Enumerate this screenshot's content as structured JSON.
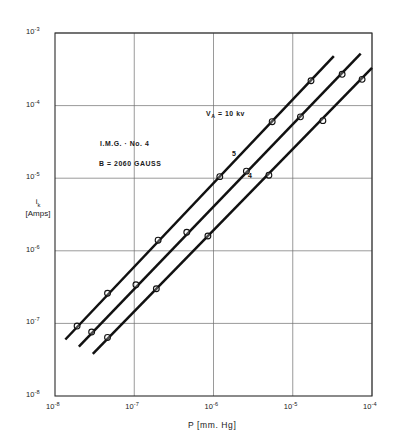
{
  "figure": {
    "title": "",
    "background": "#ffffff",
    "line_color": "#111111",
    "grid_color": "#6f6f6f",
    "frame_color": "#2b2b2b"
  },
  "axes": {
    "x": {
      "label": "P [mm. Hg]",
      "label_text": "P",
      "label_unit": "[mm. Hg]",
      "ticks": [
        "10",
        "10",
        "10",
        "10",
        "10"
      ],
      "exponents": [
        "-8",
        "-7",
        "-6",
        "-5",
        "-4"
      ],
      "min_exp": -8,
      "max_exp": -4
    },
    "y": {
      "label_symbol": "i",
      "label_sub": "k",
      "label_unit": "[Amps]",
      "ticks": [
        "10",
        "10",
        "10",
        "10",
        "10",
        "10"
      ],
      "exponents": [
        "-3",
        "-4",
        "-5",
        "-6",
        "-7",
        "-8"
      ],
      "min_exp": -8,
      "max_exp": -3
    }
  },
  "annotations": {
    "device": "I.M.G. · No. 4",
    "field": "B = 2060  GAUSS",
    "voltage_symbol": "V",
    "voltage_sub": "A",
    "voltage_value": "= 10 kv",
    "voltage_full": "V_A = 10 kv"
  },
  "curve_labels": [
    {
      "text": "5",
      "x": 232,
      "y": 150
    },
    {
      "text": "4",
      "x": 248,
      "y": 172
    }
  ],
  "chart_data": {
    "type": "line",
    "title": "",
    "subtitle": "I.M.G. · No. 4 ; B = 2060 GAUSS ; V_A = 10 kv",
    "xlabel": "P [mm. Hg]",
    "ylabel": "i_k [Amps]",
    "xscale": "log",
    "yscale": "log",
    "xlim": [
      1e-08,
      0.0001
    ],
    "ylim": [
      1e-08,
      0.001
    ],
    "xticks": [
      1e-08,
      1e-07,
      1e-06,
      1e-05,
      0.0001
    ],
    "yticks": [
      1e-08,
      1e-07,
      1e-06,
      1e-05,
      0.0001,
      0.001
    ],
    "xticklabels": [
      "10^-8",
      "10^-7",
      "10^-6",
      "10^-5",
      "10^-4"
    ],
    "yticklabels": [
      "10^-8",
      "10^-7",
      "10^-6",
      "10^-5",
      "10^-4",
      "10^-3"
    ],
    "grid": true,
    "legend": "inline-curve-labels",
    "legend_position": "inside-plot",
    "series": [
      {
        "name": "6",
        "label_shown": false,
        "marker": "open-circle",
        "x": [
          1.9e-08,
          4.6e-08,
          2e-07,
          1.2e-06,
          5.5e-06,
          1.7e-05
        ],
        "y": [
          9.2e-08,
          2.6e-07,
          1.4e-06,
          1.05e-05,
          6e-05,
          0.00022
        ],
        "line_x": [
          1.35e-08,
          3.3e-05
        ],
        "line_y": [
          6e-08,
          0.00048
        ]
      },
      {
        "name": "5",
        "label_shown": true,
        "marker": "open-circle",
        "x": [
          2.9e-08,
          1.05e-07,
          4.6e-07,
          2.6e-06,
          1.25e-05,
          4.2e-05
        ],
        "y": [
          7.6e-08,
          3.4e-07,
          1.8e-06,
          1.25e-05,
          7e-05,
          0.00027
        ],
        "line_x": [
          2e-08,
          7.2e-05
        ],
        "line_y": [
          4.8e-08,
          0.00052
        ]
      },
      {
        "name": "4",
        "label_shown": true,
        "marker": "open-circle",
        "x": [
          4.6e-08,
          1.9e-07,
          8.5e-07,
          5e-06,
          2.4e-05,
          7.5e-05
        ],
        "y": [
          6.4e-08,
          3e-07,
          1.6e-06,
          1.1e-05,
          6.2e-05,
          0.00023
        ],
        "line_x": [
          3e-08,
          0.0001
        ],
        "line_y": [
          3.8e-08,
          0.00033
        ]
      }
    ]
  }
}
